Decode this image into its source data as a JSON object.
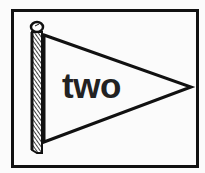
{
  "card": {
    "label": "two",
    "icon": "pennant-flag-icon",
    "colors": {
      "ink": "#111111",
      "background": "#fbfbfb"
    }
  }
}
